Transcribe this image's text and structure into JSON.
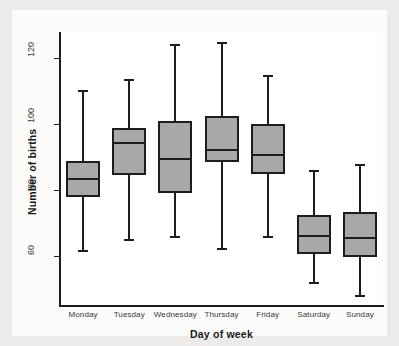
{
  "chart_data": {
    "type": "box",
    "title": "",
    "xlabel": "Day of week",
    "ylabel": "Number of births",
    "ylim": [
      45,
      128
    ],
    "yticks": [
      60,
      80,
      100,
      120
    ],
    "ytick_labels": [
      "60",
      "80",
      "100",
      "120"
    ],
    "grid": false,
    "legend": null,
    "categories": [
      "Monday",
      "Tuesday",
      "Wednesday",
      "Thursday",
      "Friday",
      "Saturday",
      "Sunday"
    ],
    "boxes": [
      {
        "category": "Monday",
        "whisker_low": 62.0,
        "q1": 78.0,
        "median": 83.9,
        "q3": 88.8,
        "whisker_high": 110.5
      },
      {
        "category": "Tuesday",
        "whisker_low": 65.2,
        "q1": 84.6,
        "median": 94.8,
        "q3": 99.0,
        "whisker_high": 113.8
      },
      {
        "category": "Wednesday",
        "whisker_low": 66.2,
        "q1": 79.2,
        "median": 89.9,
        "q3": 100.9,
        "whisker_high": 124.4
      },
      {
        "category": "Thursday",
        "whisker_low": 62.7,
        "q1": 88.5,
        "median": 92.7,
        "q3": 102.6,
        "whisker_high": 125.1
      },
      {
        "category": "Friday",
        "whisker_low": 66.3,
        "q1": 84.9,
        "median": 90.9,
        "q3": 100.0,
        "whisker_high": 114.9
      },
      {
        "category": "Saturday",
        "whisker_low": 52.4,
        "q1": 60.7,
        "median": 66.6,
        "q3": 72.6,
        "whisker_high": 86.1
      },
      {
        "category": "Sunday",
        "whisker_low": 48.2,
        "q1": 59.7,
        "median": 66.0,
        "q3": 73.4,
        "whisker_high": 88.1
      }
    ],
    "style": {
      "box_fill": "#a8a8a6",
      "line_color": "#1d1d1b",
      "plot_background": "#ffffff",
      "figure_background": "#ecebe9",
      "card_background": "#fbfbfa"
    }
  }
}
